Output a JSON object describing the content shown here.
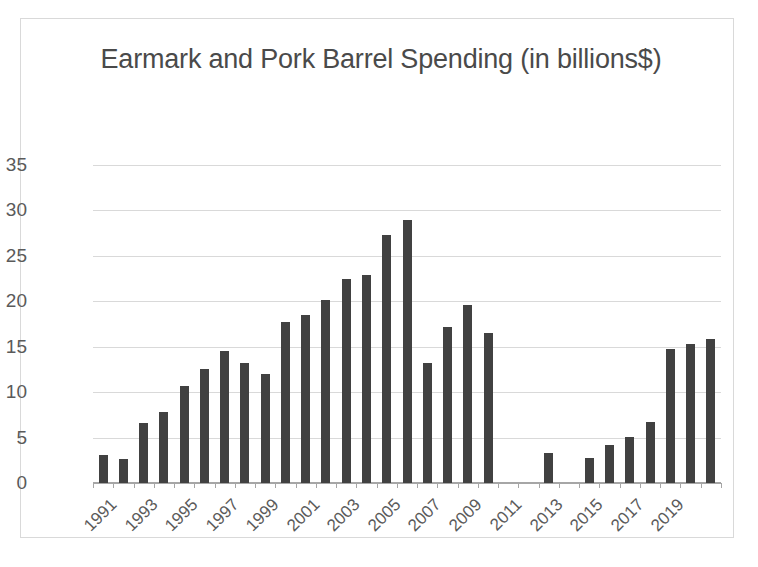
{
  "chart_data": {
    "type": "bar",
    "title": "Earmark and Pork Barrel Spending (in billions$)",
    "xlabel": "",
    "ylabel": "",
    "ylim": [
      0,
      35
    ],
    "ytick_step": 5,
    "yticks": [
      35,
      30,
      25,
      20,
      15,
      10,
      5,
      0
    ],
    "grid": true,
    "legend": false,
    "bar_color": "#414141",
    "gridline_color": "#d9d9d9",
    "axis_color": "#a6a6a6",
    "text_color": "#5a5a5a",
    "title_color": "#4a4a4a",
    "border_color": "#d9d9d9",
    "background_color": "#ffffff",
    "xtick_label_rotation": -45,
    "xtick_label_interval": 2,
    "categories": [
      "1991",
      "1992",
      "1993",
      "1994",
      "1995",
      "1996",
      "1997",
      "1998",
      "1999",
      "2000",
      "2001",
      "2002",
      "2003",
      "2004",
      "2005",
      "2006",
      "2007",
      "2008",
      "2009",
      "2010",
      "2011",
      "2012",
      "2013",
      "2014",
      "2015",
      "2016",
      "2017",
      "2018",
      "2019",
      "2020",
      "2021"
    ],
    "values": [
      3.1,
      2.6,
      6.6,
      7.8,
      10.7,
      12.5,
      14.5,
      13.2,
      12.0,
      17.7,
      18.5,
      20.1,
      22.4,
      22.9,
      27.3,
      29.0,
      13.2,
      17.2,
      19.6,
      16.5,
      0,
      0,
      3.3,
      0,
      2.7,
      4.2,
      5.1,
      6.7,
      14.8,
      15.3,
      15.9
    ],
    "xtick_labels": [
      "1991",
      "1993",
      "1995",
      "1997",
      "1999",
      "2001",
      "2003",
      "2005",
      "2007",
      "2009",
      "2011",
      "2013",
      "2015",
      "2017",
      "2019"
    ]
  }
}
